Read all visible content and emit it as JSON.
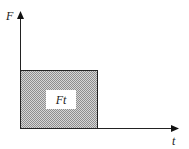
{
  "diagram": {
    "y_axis_label": "F",
    "x_axis_label": "t",
    "area_label": "Ft",
    "colors": {
      "line": "#222222",
      "fill_pattern_dark": "#9a9a9a",
      "fill_pattern_light": "#d6d6d6",
      "label_box": "#ffffff"
    }
  }
}
